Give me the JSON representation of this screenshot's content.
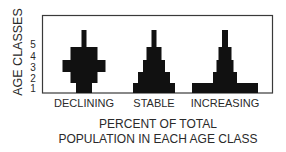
{
  "chart_data": {
    "type": "bar",
    "subtype": "population-pyramid",
    "title": "",
    "ylabel": "AGE CLASSES",
    "xlabel": "PERCENT OF TOTAL POPULATION IN EACH AGE CLASS",
    "xlabel_lines": [
      "PERCENT OF TOTAL",
      "POPULATION IN EACH AGE CLASS"
    ],
    "age_classes": [
      "1",
      "2",
      "3",
      "4",
      "5"
    ],
    "grid": false,
    "legend": "none",
    "bar_color": "#111111",
    "pyramids": [
      {
        "name": "DECLINING",
        "widths": [
          16,
          27,
          43,
          27,
          5
        ]
      },
      {
        "name": "STABLE",
        "widths": [
          42,
          32,
          22,
          15,
          5
        ]
      },
      {
        "name": "INCREASING",
        "widths": [
          66,
          24,
          17,
          13,
          6
        ]
      }
    ],
    "width_units": "relative percent of population (symmetric about center)"
  }
}
